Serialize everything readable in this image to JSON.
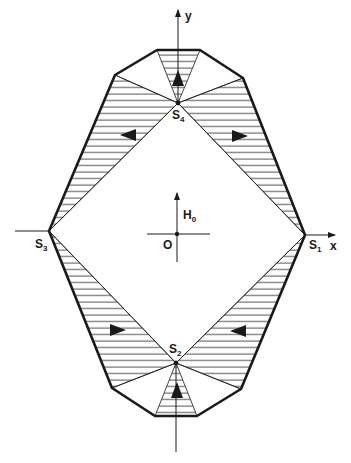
{
  "diagram": {
    "colors": {
      "ink": "#1a1a1a",
      "background": "#ffffff"
    },
    "axes": {
      "x_label": "x",
      "y_label": "y",
      "origin_label": "O"
    },
    "field": {
      "symbol": "H",
      "subscript": "0"
    },
    "points": [
      {
        "id": "S1",
        "letter": "S",
        "index": "1"
      },
      {
        "id": "S2",
        "letter": "S",
        "index": "2"
      },
      {
        "id": "S3",
        "letter": "S",
        "index": "3"
      },
      {
        "id": "S4",
        "letter": "S",
        "index": "4"
      }
    ],
    "regions": {
      "hatched": [
        "top-wedge",
        "upper-left",
        "upper-right",
        "lower-left",
        "lower-right",
        "bottom-wedge"
      ],
      "arrows": [
        "up",
        "left",
        "right",
        "right",
        "left",
        "up"
      ]
    }
  }
}
